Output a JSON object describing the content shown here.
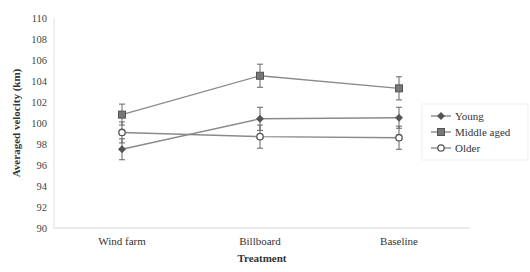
{
  "chart_data": {
    "type": "line",
    "title": "",
    "xlabel": "Treatment",
    "ylabel": "Averaged velocity (km)",
    "categories": [
      "Wind farm",
      "Billboard",
      "Baseline"
    ],
    "ylim": [
      90,
      110
    ],
    "yticks": [
      90,
      92,
      94,
      96,
      98,
      100,
      102,
      104,
      106,
      108,
      110
    ],
    "grid": false,
    "legend_position": "right",
    "series": [
      {
        "name": "Young",
        "marker": "diamond",
        "values": [
          97.5,
          100.4,
          100.5
        ],
        "error": [
          1.0,
          1.1,
          1.0
        ]
      },
      {
        "name": "Middle aged",
        "marker": "square",
        "values": [
          100.8,
          104.5,
          103.3
        ],
        "error": [
          1.0,
          1.1,
          1.1
        ]
      },
      {
        "name": "Older",
        "marker": "circle-open",
        "values": [
          99.1,
          98.7,
          98.6
        ],
        "error": [
          1.0,
          1.1,
          1.1
        ]
      }
    ],
    "colors": {
      "line": "#8a8a8a",
      "marker": "#555555",
      "axis": "#d0d0d0"
    }
  }
}
